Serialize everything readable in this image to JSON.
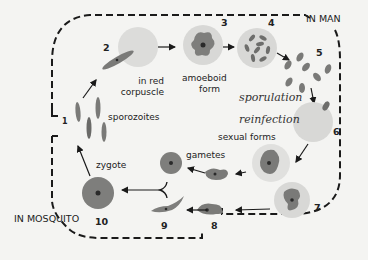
{
  "diagram": {
    "regions": {
      "man": "IN MAN",
      "mosquito": "IN MOSQUITO"
    },
    "stages": [
      {
        "number": "1",
        "label": "sporozoites"
      },
      {
        "number": "2",
        "label_line1": "in red",
        "label_line2": "corpuscle"
      },
      {
        "number": "3",
        "label_line1": "amoeboid",
        "label_line2": "form"
      },
      {
        "number": "4",
        "label": "sporulation"
      },
      {
        "number": "5",
        "label": ""
      },
      {
        "number": "6",
        "label": "reinfection"
      },
      {
        "number": "7",
        "label": "sexual forms"
      },
      {
        "number": "8",
        "label": ""
      },
      {
        "number": "9",
        "label": "gametes"
      },
      {
        "number": "10",
        "label": "zygote"
      }
    ],
    "colors": {
      "background": "#f4f4f2",
      "red_cell": "#d8d8d6",
      "parasite": "#8a8a88",
      "nucleus": "#2a2a2a",
      "dashed_border": "#1a1a1a"
    }
  }
}
